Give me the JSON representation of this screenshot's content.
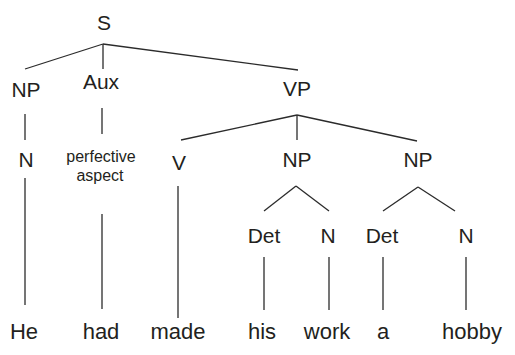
{
  "diagram": {
    "type": "syntax-tree",
    "root": "S",
    "nodes": {
      "s": "S",
      "np_subj": "NP",
      "aux": "Aux",
      "vp": "VP",
      "n_subj": "N",
      "aux_value_line1": "perfective",
      "aux_value_line2": "aspect",
      "v": "V",
      "np_obj1": "NP",
      "np_obj2": "NP",
      "det1": "Det",
      "n1": "N",
      "det2": "Det",
      "n2": "N"
    },
    "words": [
      "He",
      "had",
      "made",
      "his",
      "work",
      "a",
      "hobby"
    ],
    "tree": "[S [NP [N He]] [Aux [perfective aspect had]] [VP [V made] [NP [Det his] [N work]] [NP [Det a] [N hobby]]]]"
  }
}
